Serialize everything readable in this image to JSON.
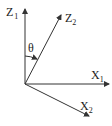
{
  "diagram": {
    "type": "coordinate-rotation",
    "origin": [
      25,
      84
    ],
    "axes": [
      {
        "id": "z1",
        "label": "Z",
        "sub": "1",
        "end": [
          25,
          8
        ]
      },
      {
        "id": "z2",
        "label": "Z",
        "sub": "2",
        "end": [
          62,
          14
        ]
      },
      {
        "id": "x1",
        "label": "X",
        "sub": "1",
        "end": [
          110,
          84
        ]
      },
      {
        "id": "x2",
        "label": "X",
        "sub": "2",
        "end": [
          90,
          117
        ]
      }
    ],
    "angle": {
      "label": "θ",
      "between": [
        "z1",
        "z2"
      ]
    }
  },
  "labels": {
    "z1_main": "Z",
    "z1_sub": "1",
    "z2_main": "Z",
    "z2_sub": "2",
    "x1_main": "X",
    "x1_sub": "1",
    "x2_main": "X",
    "x2_sub": "2",
    "theta": "θ"
  },
  "colors": {
    "stroke": "#333333",
    "background": "#ffffff"
  }
}
